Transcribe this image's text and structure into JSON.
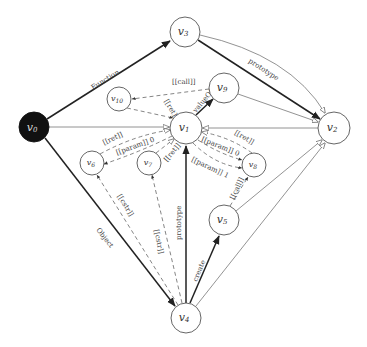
{
  "diagram": {
    "title": "",
    "nodes": [
      {
        "id": "v0",
        "label": "v0",
        "x": 34,
        "y": 127,
        "r": 15,
        "filled": true
      },
      {
        "id": "v1",
        "label": "v1",
        "x": 186,
        "y": 128,
        "r": 16,
        "filled": false
      },
      {
        "id": "v2",
        "label": "v2",
        "x": 334,
        "y": 128,
        "r": 16,
        "filled": false
      },
      {
        "id": "v3",
        "label": "v3",
        "x": 185,
        "y": 32,
        "r": 15,
        "filled": false
      },
      {
        "id": "v4",
        "label": "v4",
        "x": 186,
        "y": 318,
        "r": 15,
        "filled": false
      },
      {
        "id": "v5",
        "label": "v5",
        "x": 224,
        "y": 220,
        "r": 15,
        "filled": false
      },
      {
        "id": "v6",
        "label": "v6",
        "x": 92,
        "y": 163,
        "r": 12,
        "filled": false
      },
      {
        "id": "v7",
        "label": "v7",
        "x": 149,
        "y": 163,
        "r": 12,
        "filled": false
      },
      {
        "id": "v8",
        "label": "v8",
        "x": 254,
        "y": 165,
        "r": 12,
        "filled": false
      },
      {
        "id": "v9",
        "label": "v9",
        "x": 224,
        "y": 88,
        "r": 15,
        "filled": false
      },
      {
        "id": "v10",
        "label": "v10",
        "x": 119,
        "y": 99,
        "r": 12,
        "filled": false
      }
    ],
    "edges": [
      {
        "from": "v0",
        "to": "v3",
        "label": "Function",
        "style": "thick"
      },
      {
        "from": "v0",
        "to": "v1",
        "label": "",
        "style": "thin-open"
      },
      {
        "from": "v0",
        "to": "v4",
        "label": "Object",
        "style": "thick"
      },
      {
        "from": "v3",
        "to": "v2",
        "label": "prototype",
        "style": "thick"
      },
      {
        "from": "v3",
        "to": "v2",
        "label": "",
        "style": "thin-curved-open"
      },
      {
        "from": "v9",
        "to": "v10",
        "label": "[[call]]",
        "style": "dashed"
      },
      {
        "from": "v10",
        "to": "v1",
        "label": "[[ret]]",
        "style": "dashed"
      },
      {
        "from": "v1",
        "to": "v9",
        "label": "valueOf",
        "style": "thick"
      },
      {
        "from": "v9",
        "to": "v2",
        "label": "",
        "style": "thin-open"
      },
      {
        "from": "v2",
        "to": "v1",
        "label": "",
        "style": "thin-open"
      },
      {
        "from": "v6",
        "to": "v1",
        "label": "[[ret]]",
        "style": "dashed"
      },
      {
        "from": "v1",
        "to": "v6",
        "label": "[[param]] 0",
        "style": "dashed"
      },
      {
        "from": "v7",
        "to": "v1",
        "label": "[[ret]]",
        "style": "dashed"
      },
      {
        "from": "v8",
        "to": "v1",
        "label": "[[ret]]",
        "style": "dashed"
      },
      {
        "from": "v1",
        "to": "v8",
        "label": "[[param]] 0",
        "style": "dashed"
      },
      {
        "from": "v1",
        "to": "v8",
        "label": "[[param]] 1",
        "style": "dashed"
      },
      {
        "from": "v5",
        "to": "v8",
        "label": "[[call]]",
        "style": "dashed"
      },
      {
        "from": "v5",
        "to": "v2",
        "label": "",
        "style": "thin-open"
      },
      {
        "from": "v4",
        "to": "v2",
        "label": "",
        "style": "thin-open"
      },
      {
        "from": "v4",
        "to": "v1",
        "label": "prototype",
        "style": "thick"
      },
      {
        "from": "v4",
        "to": "v5",
        "label": "create",
        "style": "thick"
      },
      {
        "from": "v4",
        "to": "v6",
        "label": "[[cstr]]",
        "style": "dashed"
      },
      {
        "from": "v4",
        "to": "v7",
        "label": "[[cstr]]",
        "style": "dashed"
      }
    ],
    "edge_labels": {
      "function": "Function",
      "object": "Object",
      "prototype_v3_v2": "prototype",
      "prototype_v4_v1": "prototype",
      "call_v9_v10": "[[call]]",
      "ret_v10_v1": "[[ret]]",
      "valueof": "valueOf",
      "ret_v6_v1": "[[ret]]",
      "param_v1_v6": "[[param]] 0",
      "ret_v7_v1": "[[ret]]",
      "ret_v8_v1": "[[ret]]",
      "param0_v1_v8": "[[param]] 0",
      "param1_v1_v8": "[[param]] 1",
      "call_v5_v8": "[[call]]",
      "create": "create",
      "cstr_v4_v6": "[[cstr]]",
      "cstr_v4_v7": "[[cstr]]"
    },
    "node_labels": {
      "v0": "v",
      "v0_sub": "0",
      "v1": "v",
      "v1_sub": "1",
      "v2": "v",
      "v2_sub": "2",
      "v3": "v",
      "v3_sub": "3",
      "v4": "v",
      "v4_sub": "4",
      "v5": "v",
      "v5_sub": "5",
      "v6": "v",
      "v6_sub": "6",
      "v7": "v",
      "v7_sub": "7",
      "v8": "v",
      "v8_sub": "8",
      "v9": "v",
      "v9_sub": "9",
      "v10": "v",
      "v10_sub": "10"
    }
  }
}
